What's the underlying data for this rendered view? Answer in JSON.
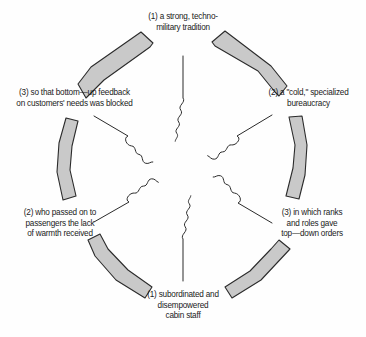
{
  "diagram": {
    "type": "cyclical-flow",
    "background_color": "#fefefe",
    "arc_fill_color": "#c9c9c9",
    "arc_stroke_color": "#2b2b2b",
    "spoke_color": "#2b2b2b",
    "text_color": "#1a1a1a",
    "node_count": 6,
    "arc_count": 6,
    "spoke_count": 6,
    "nodes": [
      {
        "id": "node-top",
        "position": "top",
        "angle_deg": 270,
        "label": "(1) a strong, techno-\nmilitary tradition"
      },
      {
        "id": "node-top-right",
        "position": "top-right",
        "angle_deg": 330,
        "label": "(2) a \"cold,\" specialized\nbureaucracy"
      },
      {
        "id": "node-bottom-right",
        "position": "bottom-right",
        "angle_deg": 30,
        "label": "(3) in which ranks\nand roles gave\ntop—down orders"
      },
      {
        "id": "node-bottom",
        "position": "bottom",
        "angle_deg": 90,
        "label": "(1) subordinated and\ndisempowered\ncabin staff"
      },
      {
        "id": "node-bottom-left",
        "position": "bottom-left",
        "angle_deg": 150,
        "label": "(2) who passed on to\npassengers the lack\nof warmth received"
      },
      {
        "id": "node-top-left",
        "position": "top-left",
        "angle_deg": 210,
        "label": "(3) so that bottom—up feedback\non customers' needs was blocked"
      }
    ]
  }
}
